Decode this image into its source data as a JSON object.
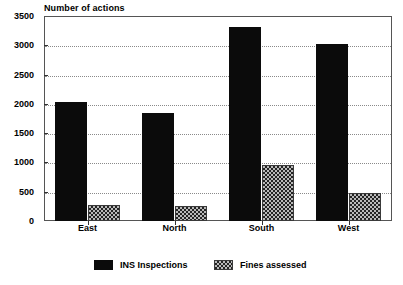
{
  "chart_data": {
    "type": "bar",
    "title": "Number of actions",
    "xlabel": "",
    "ylabel": "",
    "categories": [
      "East",
      "North",
      "South",
      "West"
    ],
    "series": [
      {
        "name": "INS Inspections",
        "values": [
          2030,
          1840,
          3310,
          3030
        ],
        "color": "#0b0b0b"
      },
      {
        "name": "Fines assessed",
        "values": [
          270,
          250,
          960,
          470
        ],
        "color": "#b9b9b9"
      }
    ],
    "ylim": [
      0,
      3500
    ],
    "yticks": [
      0,
      500,
      1000,
      1500,
      2000,
      2500,
      3000,
      3500
    ],
    "ytick_labels": [
      "0",
      "500",
      "1000",
      "1500",
      "2000",
      "2500",
      "3000",
      "3500"
    ],
    "grid": true,
    "grid_axis": "y",
    "legend_position": "bottom",
    "frame": true
  },
  "legend": {
    "entries": [
      {
        "label": "INS Inspections"
      },
      {
        "label": "Fines assessed"
      }
    ]
  }
}
